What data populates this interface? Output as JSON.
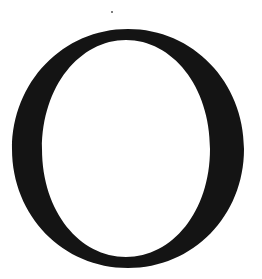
{
  "image": {
    "width": 262,
    "height": 279,
    "background": "#ffffff"
  },
  "glyph": {
    "character": "O",
    "style": "serif",
    "color": "#141414",
    "outer": {
      "cx": 128,
      "cy": 148.5,
      "rx": 116,
      "ry": 119.5
    },
    "inner": {
      "cx": 126,
      "cy": 148.5,
      "rx": 84,
      "ry": 108.5
    }
  },
  "speck": {
    "cx": 112,
    "cy": 12,
    "r": 1,
    "color": "#555555"
  }
}
